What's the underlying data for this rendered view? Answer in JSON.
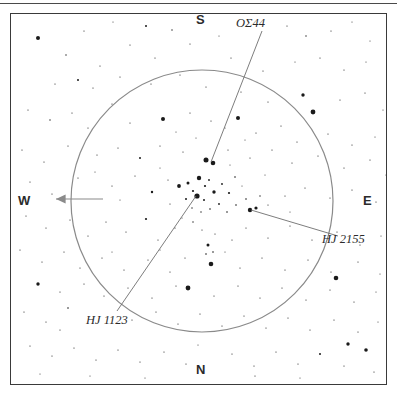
{
  "figure": {
    "type": "star-chart",
    "background_color": "#ffffff",
    "frame_color": "#3a3a3a",
    "star_color": "#1a1a1a",
    "circle_color": "#8a8a8a",
    "pointer_color": "#6e6e6e"
  },
  "cardinals": {
    "south": "S",
    "north": "N",
    "west": "W",
    "east": "E"
  },
  "labels": {
    "os44": "OΣ44",
    "hj2155": "HJ 2155",
    "hj1123": "HJ 1123"
  },
  "chart_data": {
    "type": "scatter",
    "title": "",
    "xlabel": "",
    "ylabel": "",
    "grid": false,
    "legend": false,
    "field_circle": {
      "cx": 202,
      "cy": 201,
      "r": 131,
      "stroke": "#8a8a8a",
      "stroke_width": 1.2
    },
    "west_arrow": {
      "x1": 103,
      "y1": 199,
      "x2": 56,
      "y2": 199,
      "head": 6
    },
    "pointers": [
      {
        "name": "os44",
        "x1": 262,
        "y1": 31,
        "x2": 211,
        "y2": 162
      },
      {
        "name": "hj2155",
        "x1": 251,
        "y1": 210,
        "x2": 338,
        "y2": 236
      },
      {
        "name": "hj1123",
        "x1": 196,
        "y1": 196,
        "x2": 117,
        "y2": 311
      }
    ],
    "stars": [
      {
        "x": 38,
        "y": 38,
        "r": 2.0
      },
      {
        "x": 146,
        "y": 26,
        "r": 1.0
      },
      {
        "x": 84,
        "y": 31,
        "r": 0.6
      },
      {
        "x": 113,
        "y": 22,
        "r": 0.5
      },
      {
        "x": 172,
        "y": 30,
        "r": 0.7
      },
      {
        "x": 130,
        "y": 45,
        "r": 0.6
      },
      {
        "x": 66,
        "y": 55,
        "r": 0.7
      },
      {
        "x": 100,
        "y": 66,
        "r": 0.6
      },
      {
        "x": 155,
        "y": 58,
        "r": 0.6
      },
      {
        "x": 190,
        "y": 44,
        "r": 0.6
      },
      {
        "x": 219,
        "y": 36,
        "r": 0.5
      },
      {
        "x": 231,
        "y": 58,
        "r": 0.6
      },
      {
        "x": 287,
        "y": 26,
        "r": 0.6
      },
      {
        "x": 306,
        "y": 36,
        "r": 0.7
      },
      {
        "x": 331,
        "y": 31,
        "r": 0.6
      },
      {
        "x": 352,
        "y": 22,
        "r": 0.5
      },
      {
        "x": 370,
        "y": 41,
        "r": 0.5
      },
      {
        "x": 263,
        "y": 71,
        "r": 0.6
      },
      {
        "x": 295,
        "y": 62,
        "r": 0.5
      },
      {
        "x": 320,
        "y": 58,
        "r": 0.6
      },
      {
        "x": 344,
        "y": 70,
        "r": 0.6
      },
      {
        "x": 366,
        "y": 62,
        "r": 0.5
      },
      {
        "x": 55,
        "y": 84,
        "r": 0.6
      },
      {
        "x": 78,
        "y": 80,
        "r": 1.0
      },
      {
        "x": 93,
        "y": 88,
        "r": 0.6
      },
      {
        "x": 120,
        "y": 77,
        "r": 0.6
      },
      {
        "x": 151,
        "y": 84,
        "r": 0.6
      },
      {
        "x": 180,
        "y": 75,
        "r": 0.6
      },
      {
        "x": 206,
        "y": 87,
        "r": 0.6
      },
      {
        "x": 241,
        "y": 92,
        "r": 0.6
      },
      {
        "x": 268,
        "y": 102,
        "r": 0.6
      },
      {
        "x": 303,
        "y": 95,
        "r": 1.7
      },
      {
        "x": 313,
        "y": 112,
        "r": 2.4
      },
      {
        "x": 340,
        "y": 100,
        "r": 0.6
      },
      {
        "x": 365,
        "y": 93,
        "r": 0.6
      },
      {
        "x": 383,
        "y": 110,
        "r": 0.5
      },
      {
        "x": 28,
        "y": 110,
        "r": 0.6
      },
      {
        "x": 50,
        "y": 120,
        "r": 0.7
      },
      {
        "x": 72,
        "y": 113,
        "r": 0.6
      },
      {
        "x": 88,
        "y": 128,
        "r": 0.6
      },
      {
        "x": 112,
        "y": 104,
        "r": 0.6
      },
      {
        "x": 130,
        "y": 123,
        "r": 0.6
      },
      {
        "x": 163,
        "y": 119,
        "r": 2.0
      },
      {
        "x": 190,
        "y": 113,
        "r": 0.6
      },
      {
        "x": 211,
        "y": 121,
        "r": 0.6
      },
      {
        "x": 238,
        "y": 118,
        "r": 2.0
      },
      {
        "x": 256,
        "y": 133,
        "r": 0.6
      },
      {
        "x": 281,
        "y": 126,
        "r": 0.6
      },
      {
        "x": 297,
        "y": 142,
        "r": 0.6
      },
      {
        "x": 328,
        "y": 134,
        "r": 0.6
      },
      {
        "x": 352,
        "y": 145,
        "r": 0.6
      },
      {
        "x": 375,
        "y": 137,
        "r": 0.5
      },
      {
        "x": 22,
        "y": 150,
        "r": 0.6
      },
      {
        "x": 44,
        "y": 162,
        "r": 0.6
      },
      {
        "x": 68,
        "y": 146,
        "r": 0.6
      },
      {
        "x": 97,
        "y": 155,
        "r": 0.6
      },
      {
        "x": 118,
        "y": 148,
        "r": 0.6
      },
      {
        "x": 140,
        "y": 158,
        "r": 1.0
      },
      {
        "x": 160,
        "y": 146,
        "r": 0.6
      },
      {
        "x": 183,
        "y": 152,
        "r": 0.6
      },
      {
        "x": 206,
        "y": 160,
        "r": 2.5
      },
      {
        "x": 213,
        "y": 163,
        "r": 2.3
      },
      {
        "x": 228,
        "y": 150,
        "r": 0.6
      },
      {
        "x": 250,
        "y": 158,
        "r": 0.6
      },
      {
        "x": 272,
        "y": 150,
        "r": 0.6
      },
      {
        "x": 292,
        "y": 163,
        "r": 0.6
      },
      {
        "x": 318,
        "y": 156,
        "r": 0.6
      },
      {
        "x": 344,
        "y": 168,
        "r": 0.6
      },
      {
        "x": 370,
        "y": 160,
        "r": 0.6
      },
      {
        "x": 386,
        "y": 175,
        "r": 0.5
      },
      {
        "x": 30,
        "y": 182,
        "r": 0.6
      },
      {
        "x": 52,
        "y": 194,
        "r": 0.6
      },
      {
        "x": 78,
        "y": 178,
        "r": 0.6
      },
      {
        "x": 112,
        "y": 186,
        "r": 0.6
      },
      {
        "x": 135,
        "y": 176,
        "r": 0.6
      },
      {
        "x": 152,
        "y": 192,
        "r": 1.2
      },
      {
        "x": 168,
        "y": 180,
        "r": 0.6
      },
      {
        "x": 179,
        "y": 186,
        "r": 1.9
      },
      {
        "x": 188,
        "y": 183,
        "r": 1.5
      },
      {
        "x": 193,
        "y": 191,
        "r": 1.1
      },
      {
        "x": 199,
        "y": 178,
        "r": 2.2
      },
      {
        "x": 205,
        "y": 186,
        "r": 1.1
      },
      {
        "x": 209,
        "y": 180,
        "r": 0.9
      },
      {
        "x": 197,
        "y": 196,
        "r": 2.6
      },
      {
        "x": 186,
        "y": 199,
        "r": 1.0
      },
      {
        "x": 204,
        "y": 200,
        "r": 1.0
      },
      {
        "x": 214,
        "y": 192,
        "r": 1.7
      },
      {
        "x": 222,
        "y": 184,
        "r": 0.9
      },
      {
        "x": 229,
        "y": 193,
        "r": 1.1
      },
      {
        "x": 235,
        "y": 177,
        "r": 0.8
      },
      {
        "x": 219,
        "y": 204,
        "r": 0.9
      },
      {
        "x": 210,
        "y": 209,
        "r": 0.8
      },
      {
        "x": 201,
        "y": 212,
        "r": 0.7
      },
      {
        "x": 192,
        "y": 208,
        "r": 0.7
      },
      {
        "x": 227,
        "y": 212,
        "r": 0.8
      },
      {
        "x": 236,
        "y": 205,
        "r": 0.8
      },
      {
        "x": 246,
        "y": 199,
        "r": 0.8
      },
      {
        "x": 250,
        "y": 210,
        "r": 2.2
      },
      {
        "x": 256,
        "y": 208,
        "r": 1.6
      },
      {
        "x": 260,
        "y": 196,
        "r": 0.7
      },
      {
        "x": 268,
        "y": 205,
        "r": 0.6
      },
      {
        "x": 285,
        "y": 196,
        "r": 0.6
      },
      {
        "x": 305,
        "y": 188,
        "r": 0.6
      },
      {
        "x": 330,
        "y": 198,
        "r": 0.6
      },
      {
        "x": 352,
        "y": 190,
        "r": 0.6
      },
      {
        "x": 376,
        "y": 202,
        "r": 0.6
      },
      {
        "x": 26,
        "y": 216,
        "r": 0.6
      },
      {
        "x": 46,
        "y": 228,
        "r": 0.6
      },
      {
        "x": 70,
        "y": 220,
        "r": 0.6
      },
      {
        "x": 88,
        "y": 236,
        "r": 0.6
      },
      {
        "x": 106,
        "y": 222,
        "r": 0.6
      },
      {
        "x": 126,
        "y": 232,
        "r": 0.6
      },
      {
        "x": 146,
        "y": 219,
        "r": 1.1
      },
      {
        "x": 158,
        "y": 240,
        "r": 0.6
      },
      {
        "x": 175,
        "y": 228,
        "r": 0.6
      },
      {
        "x": 193,
        "y": 222,
        "r": 0.7
      },
      {
        "x": 202,
        "y": 230,
        "r": 0.6
      },
      {
        "x": 215,
        "y": 234,
        "r": 0.6
      },
      {
        "x": 232,
        "y": 240,
        "r": 0.6
      },
      {
        "x": 208,
        "y": 245,
        "r": 1.5
      },
      {
        "x": 213,
        "y": 252,
        "r": 0.8
      },
      {
        "x": 206,
        "y": 254,
        "r": 0.8
      },
      {
        "x": 246,
        "y": 228,
        "r": 0.6
      },
      {
        "x": 268,
        "y": 238,
        "r": 0.6
      },
      {
        "x": 290,
        "y": 226,
        "r": 0.6
      },
      {
        "x": 312,
        "y": 240,
        "r": 0.6
      },
      {
        "x": 337,
        "y": 232,
        "r": 0.6
      },
      {
        "x": 360,
        "y": 245,
        "r": 0.6
      },
      {
        "x": 381,
        "y": 236,
        "r": 0.5
      },
      {
        "x": 20,
        "y": 250,
        "r": 0.6
      },
      {
        "x": 42,
        "y": 262,
        "r": 0.6
      },
      {
        "x": 64,
        "y": 252,
        "r": 0.6
      },
      {
        "x": 80,
        "y": 268,
        "r": 0.6
      },
      {
        "x": 102,
        "y": 258,
        "r": 0.6
      },
      {
        "x": 124,
        "y": 270,
        "r": 0.6
      },
      {
        "x": 148,
        "y": 260,
        "r": 0.6
      },
      {
        "x": 170,
        "y": 272,
        "r": 0.6
      },
      {
        "x": 185,
        "y": 258,
        "r": 0.6
      },
      {
        "x": 211,
        "y": 264,
        "r": 2.3
      },
      {
        "x": 240,
        "y": 268,
        "r": 0.6
      },
      {
        "x": 262,
        "y": 258,
        "r": 0.6
      },
      {
        "x": 285,
        "y": 270,
        "r": 0.6
      },
      {
        "x": 308,
        "y": 260,
        "r": 0.6
      },
      {
        "x": 331,
        "y": 272,
        "r": 0.6
      },
      {
        "x": 336,
        "y": 278,
        "r": 2.3
      },
      {
        "x": 358,
        "y": 262,
        "r": 0.6
      },
      {
        "x": 380,
        "y": 274,
        "r": 0.5
      },
      {
        "x": 38,
        "y": 284,
        "r": 1.7
      },
      {
        "x": 60,
        "y": 292,
        "r": 0.6
      },
      {
        "x": 84,
        "y": 284,
        "r": 0.6
      },
      {
        "x": 104,
        "y": 296,
        "r": 0.6
      },
      {
        "x": 128,
        "y": 288,
        "r": 0.6
      },
      {
        "x": 152,
        "y": 298,
        "r": 0.6
      },
      {
        "x": 176,
        "y": 286,
        "r": 0.6
      },
      {
        "x": 188,
        "y": 288,
        "r": 2.4
      },
      {
        "x": 214,
        "y": 296,
        "r": 0.6
      },
      {
        "x": 238,
        "y": 286,
        "r": 0.6
      },
      {
        "x": 260,
        "y": 298,
        "r": 0.6
      },
      {
        "x": 282,
        "y": 288,
        "r": 0.6
      },
      {
        "x": 306,
        "y": 300,
        "r": 0.6
      },
      {
        "x": 330,
        "y": 290,
        "r": 0.6
      },
      {
        "x": 354,
        "y": 302,
        "r": 0.6
      },
      {
        "x": 376,
        "y": 292,
        "r": 0.5
      },
      {
        "x": 24,
        "y": 312,
        "r": 0.6
      },
      {
        "x": 46,
        "y": 322,
        "r": 0.6
      },
      {
        "x": 68,
        "y": 308,
        "r": 0.8
      },
      {
        "x": 60,
        "y": 330,
        "r": 0.6
      },
      {
        "x": 132,
        "y": 320,
        "r": 0.6
      },
      {
        "x": 156,
        "y": 312,
        "r": 0.6
      },
      {
        "x": 178,
        "y": 324,
        "r": 0.6
      },
      {
        "x": 200,
        "y": 314,
        "r": 0.6
      },
      {
        "x": 222,
        "y": 326,
        "r": 0.6
      },
      {
        "x": 244,
        "y": 316,
        "r": 0.6
      },
      {
        "x": 266,
        "y": 328,
        "r": 0.6
      },
      {
        "x": 288,
        "y": 318,
        "r": 0.6
      },
      {
        "x": 310,
        "y": 330,
        "r": 0.6
      },
      {
        "x": 334,
        "y": 320,
        "r": 0.6
      },
      {
        "x": 358,
        "y": 332,
        "r": 0.6
      },
      {
        "x": 378,
        "y": 322,
        "r": 0.5
      },
      {
        "x": 30,
        "y": 346,
        "r": 0.6
      },
      {
        "x": 52,
        "y": 356,
        "r": 0.6
      },
      {
        "x": 74,
        "y": 348,
        "r": 0.6
      },
      {
        "x": 96,
        "y": 360,
        "r": 0.6
      },
      {
        "x": 118,
        "y": 350,
        "r": 0.6
      },
      {
        "x": 140,
        "y": 362,
        "r": 0.6
      },
      {
        "x": 164,
        "y": 352,
        "r": 0.6
      },
      {
        "x": 186,
        "y": 364,
        "r": 0.6
      },
      {
        "x": 232,
        "y": 354,
        "r": 0.6
      },
      {
        "x": 254,
        "y": 366,
        "r": 0.6
      },
      {
        "x": 276,
        "y": 352,
        "r": 0.6
      },
      {
        "x": 298,
        "y": 364,
        "r": 0.6
      },
      {
        "x": 320,
        "y": 354,
        "r": 1.0
      },
      {
        "x": 344,
        "y": 366,
        "r": 0.6
      },
      {
        "x": 366,
        "y": 350,
        "r": 1.8
      },
      {
        "x": 348,
        "y": 344,
        "r": 1.7
      },
      {
        "x": 374,
        "y": 372,
        "r": 0.6
      },
      {
        "x": 255,
        "y": 376,
        "r": 0.6
      },
      {
        "x": 300,
        "y": 378,
        "r": 0.5
      },
      {
        "x": 40,
        "y": 374,
        "r": 0.5
      },
      {
        "x": 90,
        "y": 376,
        "r": 0.5
      },
      {
        "x": 145,
        "y": 378,
        "r": 0.5
      },
      {
        "x": 198,
        "y": 345,
        "r": 0.5
      },
      {
        "x": 120,
        "y": 200,
        "r": 0.5
      },
      {
        "x": 95,
        "y": 172,
        "r": 0.5
      },
      {
        "x": 265,
        "y": 175,
        "r": 0.5
      },
      {
        "x": 290,
        "y": 212,
        "r": 0.5
      },
      {
        "x": 170,
        "y": 204,
        "r": 0.6
      },
      {
        "x": 160,
        "y": 168,
        "r": 0.5
      },
      {
        "x": 245,
        "y": 140,
        "r": 0.5
      },
      {
        "x": 225,
        "y": 128,
        "r": 0.5
      },
      {
        "x": 196,
        "y": 138,
        "r": 0.5
      },
      {
        "x": 176,
        "y": 132,
        "r": 0.5
      },
      {
        "x": 230,
        "y": 165,
        "r": 0.5
      },
      {
        "x": 242,
        "y": 186,
        "r": 0.5
      },
      {
        "x": 182,
        "y": 218,
        "r": 0.5
      },
      {
        "x": 225,
        "y": 252,
        "r": 0.5
      },
      {
        "x": 160,
        "y": 250,
        "r": 0.5
      },
      {
        "x": 112,
        "y": 252,
        "r": 0.5
      }
    ]
  }
}
